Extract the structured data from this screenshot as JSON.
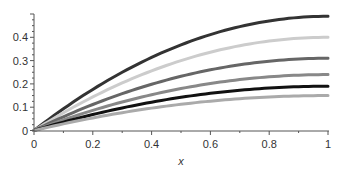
{
  "chart_data": {
    "type": "line",
    "title": "",
    "xlabel": "x",
    "ylabel": "",
    "xlim": [
      0,
      1
    ],
    "ylim": [
      0,
      0.5
    ],
    "grid": false,
    "legend": null,
    "x_ticks": [
      0,
      0.2,
      0.4,
      0.6,
      0.8,
      1
    ],
    "x_tick_labels": [
      "0",
      "0.2",
      "0.4",
      "0.6",
      "0.8",
      "1"
    ],
    "y_ticks": [
      0,
      0.1,
      0.2,
      0.3,
      0.4
    ],
    "y_tick_labels": [
      "0",
      "0.1",
      "0.2",
      "0.3",
      "0.4"
    ],
    "x": [
      0,
      0.1,
      0.2,
      0.3,
      0.4,
      0.5,
      0.6,
      0.7,
      0.8,
      0.9,
      1.0
    ],
    "series": [
      {
        "name": "curve-1",
        "color": "#333333",
        "amplitude": 0.49,
        "values": [
          0,
          0.093,
          0.176,
          0.25,
          0.314,
          0.368,
          0.412,
          0.446,
          0.47,
          0.485,
          0.49
        ]
      },
      {
        "name": "curve-2",
        "color": "#cccccc",
        "amplitude": 0.4,
        "values": [
          0,
          0.076,
          0.144,
          0.204,
          0.256,
          0.3,
          0.336,
          0.364,
          0.384,
          0.396,
          0.4
        ]
      },
      {
        "name": "curve-3",
        "color": "#666666",
        "amplitude": 0.31,
        "values": [
          0,
          0.059,
          0.112,
          0.158,
          0.198,
          0.233,
          0.26,
          0.282,
          0.298,
          0.307,
          0.31
        ]
      },
      {
        "name": "curve-4",
        "color": "#888888",
        "amplitude": 0.24,
        "values": [
          0,
          0.046,
          0.086,
          0.122,
          0.154,
          0.18,
          0.202,
          0.218,
          0.23,
          0.238,
          0.24
        ]
      },
      {
        "name": "curve-5",
        "color": "#111111",
        "amplitude": 0.19,
        "values": [
          0,
          0.036,
          0.068,
          0.097,
          0.122,
          0.143,
          0.16,
          0.173,
          0.182,
          0.188,
          0.19
        ]
      },
      {
        "name": "curve-6",
        "color": "#aaaaaa",
        "amplitude": 0.15,
        "values": [
          0,
          0.029,
          0.054,
          0.077,
          0.096,
          0.113,
          0.126,
          0.137,
          0.144,
          0.149,
          0.15
        ]
      }
    ]
  }
}
